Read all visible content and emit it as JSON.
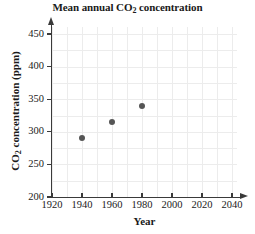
{
  "chart_data": {
    "type": "scatter",
    "title": "Mean annual CO2 concentration",
    "title_parts": {
      "before": "Mean annual CO",
      "sub": "2",
      "after": " concentration"
    },
    "xlabel": "Year",
    "ylabel": "CO2 concentration (ppm)",
    "ylabel_parts": {
      "before": "CO",
      "sub": "2",
      "after": " concentration (ppm)"
    },
    "x": [
      1940,
      1960,
      1980
    ],
    "values": [
      290,
      315,
      340
    ],
    "points": [
      {
        "x": 1940,
        "y": 290
      },
      {
        "x": 1960,
        "y": 315
      },
      {
        "x": 1980,
        "y": 340
      }
    ],
    "xlim": [
      1920,
      2045
    ],
    "ylim": [
      200,
      460
    ],
    "xticks": [
      1920,
      1940,
      1960,
      1980,
      2000,
      2020,
      2040
    ],
    "yticks": [
      200,
      250,
      300,
      350,
      400,
      450
    ],
    "xtick_labels": [
      "1920",
      "1940",
      "1960",
      "1980",
      "2000",
      "2020",
      "2040"
    ],
    "ytick_labels": [
      "200",
      "250",
      "300",
      "350",
      "400",
      "450"
    ],
    "x_minor_step": 10,
    "y_minor_step": 25,
    "grid": true,
    "legend": "none",
    "marker_color": "#555555",
    "grid_color": "#ececec",
    "axis_color": "#3a3a3a",
    "background_color": "#ffffff"
  }
}
